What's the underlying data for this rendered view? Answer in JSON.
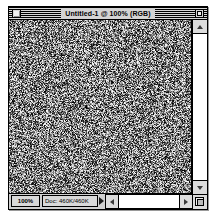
{
  "app": {
    "name": "Adobe Photoshop",
    "platform": "Classic Mac OS"
  },
  "window": {
    "title": "Untitled-1 @ 100% (RGB)",
    "document_name": "Untitled-1",
    "zoom_in_title": "100%",
    "color_mode": "RGB",
    "close_box_name": "close-box",
    "zoom_box_name": "zoom-box"
  },
  "canvas": {
    "content_description": "monochromatic random noise fill",
    "noise_type": "grayscale-noise",
    "mean_gray": "#9a9a9a",
    "width_px": 182,
    "height_px": 173
  },
  "status_bar": {
    "zoom_level": "100%",
    "doc_size": "Doc: 460K/460K",
    "doc_size_popup_icon": "triangle-right-icon"
  },
  "scrollbars": {
    "vertical": {
      "up_arrow_icon": "triangle-up-icon",
      "down_arrow_icon": "triangle-down-icon"
    },
    "horizontal": {
      "left_arrow_icon": "triangle-left-icon",
      "right_arrow_icon": "triangle-right-icon"
    }
  },
  "grow_box": {
    "icon": "resize-handle-icon"
  },
  "colors": {
    "window_chrome": "#cfcfcf",
    "frame_border": "#000000",
    "field_fill": "#d9d9d9",
    "scroll_track": "#ffffff",
    "arrow_button": "#dcdcdc",
    "desktop": "#ffffff"
  }
}
